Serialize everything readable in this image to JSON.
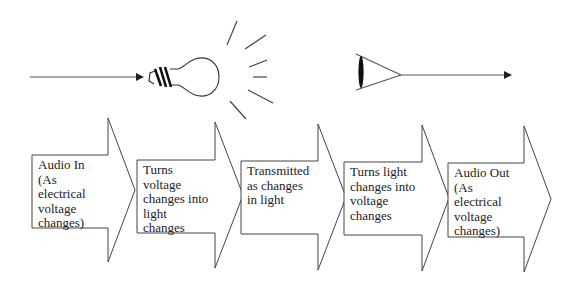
{
  "diagram": {
    "type": "process-flow",
    "colors": {
      "stroke": "#333333",
      "background": "#ffffff",
      "text": "#222222"
    },
    "top_row": {
      "input_arrow": {
        "from": "left",
        "to": "light-bulb"
      },
      "light_bulb": {
        "icon": "light-bulb-icon",
        "rays": 6
      },
      "eye_receiver": {
        "icon": "eye-lens-icon"
      },
      "output_arrow": {
        "from": "eye-lens",
        "to": "right"
      }
    },
    "steps": [
      {
        "id": 1,
        "text": "Audio In\n(As\nelectrical\nvoltage\nchanges)"
      },
      {
        "id": 2,
        "text": "Turns\nvoltage\nchanges into\nlight\nchanges"
      },
      {
        "id": 3,
        "text": "Transmitted\nas changes\nin light"
      },
      {
        "id": 4,
        "text": "Turns light\nchanges into\nvoltage\nchanges"
      },
      {
        "id": 5,
        "text": "Audio Out\n(As\nelectrical\nvoltage\nchanges)"
      }
    ]
  }
}
